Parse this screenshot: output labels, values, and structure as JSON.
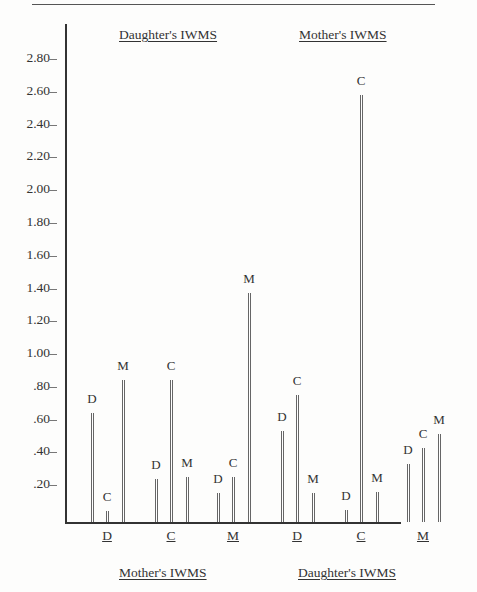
{
  "chart_data": {
    "type": "bar",
    "title": "",
    "top_headers": [
      "Daughter's IWMS",
      "Mother's IWMS"
    ],
    "bottom_headers": [
      "Mother's IWMS",
      "Daughter's IWMS"
    ],
    "categories": [
      "D",
      "C",
      "M",
      "D",
      "C",
      "M"
    ],
    "series_labels": [
      "D",
      "C",
      "M"
    ],
    "groups": [
      {
        "category": "D",
        "values": {
          "D": 0.64,
          "C": 0.04,
          "M": 0.84
        }
      },
      {
        "category": "C",
        "values": {
          "D": 0.24,
          "C": 0.84,
          "M": 0.25
        }
      },
      {
        "category": "M",
        "values": {
          "D": 0.15,
          "C": 0.25,
          "M": 1.37
        }
      },
      {
        "category": "D",
        "values": {
          "D": 0.53,
          "C": 0.75,
          "M": 0.15
        }
      },
      {
        "category": "C",
        "values": {
          "D": 0.05,
          "C": 2.58,
          "M": 0.16
        }
      },
      {
        "category": "M",
        "values": {
          "D": 0.33,
          "C": 0.43,
          "M": 0.51
        }
      }
    ],
    "series": [
      {
        "name": "D",
        "values": [
          0.64,
          0.24,
          0.15,
          0.53,
          0.05,
          0.33
        ]
      },
      {
        "name": "C",
        "values": [
          0.04,
          0.84,
          0.25,
          0.75,
          2.58,
          0.43
        ]
      },
      {
        "name": "M",
        "values": [
          0.84,
          0.25,
          1.37,
          0.15,
          0.16,
          0.51
        ]
      }
    ],
    "yticks": [
      ".20",
      ".40",
      ".60",
      ".80",
      "1.00",
      "1.20",
      "1.40",
      "1.60",
      "1.80",
      "2.00",
      "2.20",
      "2.40",
      "2.60",
      "2.80"
    ],
    "ylim": [
      0,
      2.9
    ],
    "xlabel": "",
    "ylabel": "",
    "grid": false,
    "legend": "none"
  }
}
